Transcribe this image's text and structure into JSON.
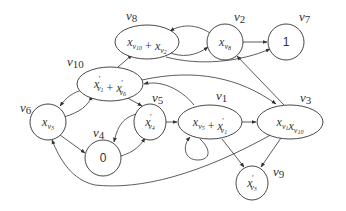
{
  "diagram": {
    "type": "directed-graph",
    "nodes": [
      {
        "id": "v8",
        "label": "v8",
        "content": [
          {
            "b": "x",
            "s": "v",
            "ss": "10"
          },
          {
            "op": "+"
          },
          {
            "b": "x",
            "s": "v",
            "ss": "2"
          }
        ],
        "shape": "ellipse"
      },
      {
        "id": "v2",
        "label": "v2",
        "content": [
          {
            "b": "x",
            "s": "v",
            "ss": "8"
          }
        ],
        "shape": "circle"
      },
      {
        "id": "v7",
        "label": "v7",
        "content": [
          {
            "num": "1"
          }
        ],
        "shape": "circle"
      },
      {
        "id": "v10",
        "label": "v10",
        "content": [
          {
            "b": "x",
            "p": "′",
            "s": "v",
            "ss": "1"
          },
          {
            "op": "+"
          },
          {
            "b": "x",
            "p": "′",
            "s": "v",
            "ss": "6"
          }
        ],
        "shape": "ellipse"
      },
      {
        "id": "v6",
        "label": "v6",
        "content": [
          {
            "b": "x",
            "s": "v",
            "ss": "3"
          }
        ],
        "shape": "circle"
      },
      {
        "id": "v5",
        "label": "v5",
        "content": [
          {
            "b": "x",
            "p": "′",
            "s": "v",
            "ss": "4"
          }
        ],
        "shape": "circle"
      },
      {
        "id": "v4",
        "label": "v4",
        "content": [
          {
            "num": "0"
          }
        ],
        "shape": "circle"
      },
      {
        "id": "v1",
        "label": "v1",
        "content": [
          {
            "b": "x",
            "s": "v",
            "ss": "5"
          },
          {
            "op": "+"
          },
          {
            "b": "x",
            "p": "′",
            "s": "v",
            "ss": "1"
          }
        ],
        "shape": "ellipse"
      },
      {
        "id": "v3",
        "label": "v3",
        "content": [
          {
            "b": "x",
            "s": "v",
            "ss": "1"
          },
          {
            "b": "x",
            "s": "v",
            "ss": "10"
          }
        ],
        "shape": "ellipse"
      },
      {
        "id": "v9",
        "label": "v9",
        "content": [
          {
            "b": "x",
            "p": "′",
            "s": "v",
            "ss": "3"
          }
        ],
        "shape": "circle"
      }
    ],
    "edges": [
      {
        "from": "v10",
        "to": "v8"
      },
      {
        "from": "v8",
        "to": "v2"
      },
      {
        "from": "v2",
        "to": "v8"
      },
      {
        "from": "v2",
        "to": "v7"
      },
      {
        "from": "v8",
        "to": "v7"
      },
      {
        "from": "v10",
        "to": "v6"
      },
      {
        "from": "v6",
        "to": "v10"
      },
      {
        "from": "v10",
        "to": "v5"
      },
      {
        "from": "v10",
        "to": "v3"
      },
      {
        "from": "v1",
        "to": "v10"
      },
      {
        "from": "v3",
        "to": "v2"
      },
      {
        "from": "v6",
        "to": "v4"
      },
      {
        "from": "v4",
        "to": "v5"
      },
      {
        "from": "v5",
        "to": "v4"
      },
      {
        "from": "v5",
        "to": "v1"
      },
      {
        "from": "v1",
        "to": "v1"
      },
      {
        "from": "v1",
        "to": "v3"
      },
      {
        "from": "v1",
        "to": "v9"
      },
      {
        "from": "v3",
        "to": "v9"
      },
      {
        "from": "v3",
        "to": "v6"
      }
    ]
  }
}
